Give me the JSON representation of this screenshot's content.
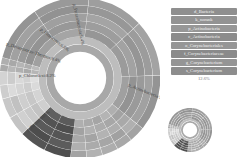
{
  "chart_data": {
    "type": "sunburst",
    "title": "",
    "center": {
      "x": 80,
      "y": 78,
      "inner_radius": 26
    },
    "rings": 7,
    "ring_width": 7.8,
    "segments_top_level": [
      {
        "name": "p_Actinobacteria",
        "percent": 56.7,
        "start": -75,
        "end": 129,
        "color": "#9a9a9a"
      },
      {
        "name": "p_Bacteroidetes",
        "percent": 13.5,
        "start": 129,
        "end": 187,
        "color": "#a9a9a9"
      },
      {
        "name": "p_Chloroflexi",
        "percent": 8.2,
        "start": 187,
        "end": 226,
        "color": "#555555"
      },
      {
        "name": "p_Deinococcus-Thermus",
        "percent": 8.4,
        "start": 226,
        "end": 255,
        "color": "#c9c9c9"
      },
      {
        "name": "p_Firmicutes",
        "percent": 6.8,
        "start": 255,
        "end": 275,
        "color": "#d4d4d4"
      },
      {
        "name": "p_Proteobacteria",
        "percent": 6.4,
        "start": 275,
        "end": 285,
        "color": "#b0b0b0"
      }
    ],
    "labels": [
      {
        "text": "p_Actinobacteria:56.7%",
        "x": 128,
        "y": 86,
        "rotate": 22
      },
      {
        "text": "p_Bacteroidetes",
        "x": 28,
        "y": 132,
        "rotate": -42
      },
      {
        "text": "p_Chloroflexi:8.2%",
        "x": 19,
        "y": 77,
        "rotate": 0
      },
      {
        "text": "p_Deinococcus-Thermus:8.4%",
        "x": 6,
        "y": 45,
        "rotate": 18
      },
      {
        "text": "p_Firmicutes:6.8%",
        "x": 40,
        "y": 30,
        "rotate": 38
      },
      {
        "text": "p_Proteobacteria:6.4%",
        "x": 73,
        "y": 4,
        "rotate": 78
      }
    ],
    "legend": {
      "items": [
        {
          "label": "d_Bacteria",
          "color": "#8f8f8f"
        },
        {
          "label": "k_norank",
          "color": "#939393"
        },
        {
          "label": "p_Actinobacteria",
          "color": "#979797"
        },
        {
          "label": "c_Actinobacteria",
          "color": "#8c8c8c"
        },
        {
          "label": "o_Corynebacteriales",
          "color": "#969696"
        },
        {
          "label": "f_Corynebacteriaceae",
          "color": "#8a8a8a"
        },
        {
          "label": "g_Corynebacterium",
          "color": "#959595"
        },
        {
          "label": "s_Corynebacterium",
          "color": "#8d8d8d"
        }
      ],
      "percent": "12.6%"
    }
  }
}
